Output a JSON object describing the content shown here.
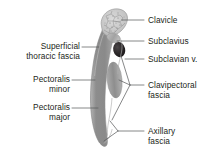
{
  "figure": {
    "background_color": "#ffffff",
    "width": 214,
    "height": 160
  },
  "colors": {
    "text": "#231f20",
    "leader_line": "#58595b",
    "muscle_gray": "#9b9b9b",
    "muscle_gray_dark": "#8a8a8a",
    "bone_gray": "#c9c9c9",
    "bone_speckle": "#6f6f6f",
    "vein_dark": "#231f20",
    "fascia_line": "#a7a7a7"
  },
  "labels_left": [
    {
      "name": "superficial-thoracic-fascia",
      "lines": [
        "Superficial",
        "thoracic fascia"
      ],
      "line1": "Superficial",
      "line2": "thoracic fascia"
    },
    {
      "name": "pectoralis-minor",
      "lines": [
        "Pectoralis",
        "minor"
      ],
      "line1": "Pectoralis",
      "line2": "minor"
    },
    {
      "name": "pectoralis-major",
      "lines": [
        "Pectoralis",
        "major"
      ],
      "line1": "Pectoralis",
      "line2": "major"
    }
  ],
  "labels_right": [
    {
      "name": "clavicle",
      "lines": [
        "Clavicle"
      ],
      "line1": "Clavicle",
      "line2": ""
    },
    {
      "name": "subclavius",
      "lines": [
        "Subclavius"
      ],
      "line1": "Subclavius",
      "line2": ""
    },
    {
      "name": "subclavian-vein",
      "lines": [
        "Subclavian v."
      ],
      "line1": "Subclavian v.",
      "line2": ""
    },
    {
      "name": "clavipectoral-fascia",
      "lines": [
        "Clavipectoral",
        "fascia"
      ],
      "line1": "Clavipectoral",
      "line2": "fascia"
    },
    {
      "name": "axillary-fascia",
      "lines": [
        "Axillary",
        "fascia"
      ],
      "line1": "Axillary",
      "line2": "fascia"
    }
  ],
  "structures": [
    {
      "name": "clavicle",
      "description": "cut end of clavicle with trabecular bone texture"
    },
    {
      "name": "subclavius-muscle",
      "description": "small muscle inferior to clavicle"
    },
    {
      "name": "subclavian-vein",
      "description": "dark oval vessel lumen"
    },
    {
      "name": "pectoralis-minor-muscle",
      "description": "gray oval muscle belly"
    },
    {
      "name": "pectoralis-major-muscle",
      "description": "long curved gray muscle band"
    },
    {
      "name": "clavipectoral-fascia",
      "description": "fascia enveloping subclavius and pectoralis minor"
    },
    {
      "name": "axillary-fascia",
      "description": "fascia at the inferior axillary border"
    },
    {
      "name": "superficial-thoracic-fascia",
      "description": "superficial fascial layer over pectoralis major"
    }
  ]
}
